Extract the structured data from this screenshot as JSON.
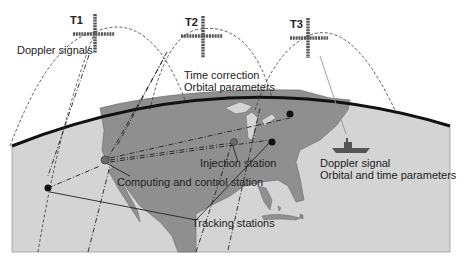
{
  "satellites": [
    {
      "id": "T1",
      "label": "T1"
    },
    {
      "id": "T2",
      "label": "T2"
    },
    {
      "id": "T3",
      "label": "T3"
    }
  ],
  "labels": {
    "doppler_signals": "Doppler signals",
    "time_correction": "Time correction",
    "orbital_parameters": "Orbital parameters",
    "injection_station": "Injection station",
    "computing_control": "Computing and control station",
    "tracking_stations": "Tracking stations",
    "doppler_signal": "Doppler signal",
    "orbital_time_params": "Orbital and time parameters"
  },
  "colors": {
    "ocean": "#d4d4d4",
    "land": "#8f8f8f",
    "horizon": "#111111",
    "station_dark": "#111111",
    "station_gray": "#6a6a6a"
  }
}
